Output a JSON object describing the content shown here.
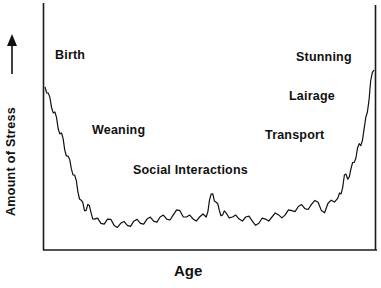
{
  "chart_data": {
    "type": "line",
    "title": "",
    "xlabel": "Age",
    "ylabel": "Amount of Stress",
    "ylabel_arrow": "up",
    "grid": false,
    "legend": null,
    "axis_ranges": {
      "x": [
        0,
        100
      ],
      "y": [
        0,
        100
      ]
    },
    "ticks": {
      "x": [],
      "y": []
    },
    "annotations": [
      {
        "text": "Birth",
        "x": 4,
        "y": 78
      },
      {
        "text": "Weaning",
        "x": 15,
        "y": 48
      },
      {
        "text": "Social Interactions",
        "x": 27,
        "y": 32
      },
      {
        "text": "Stunning",
        "x": 76,
        "y": 77
      },
      {
        "text": "Lairage",
        "x": 74,
        "y": 61
      },
      {
        "text": "Transport",
        "x": 67,
        "y": 46
      }
    ],
    "series": [
      {
        "name": "Stress",
        "description": "U-shaped noisy curve: high at birth, drops through weaning to a low plateau, small peak at social interactions, rises through transport and lairage to maximum at stunning",
        "x": [
          0,
          1,
          2,
          3,
          4,
          5,
          6,
          7,
          8,
          9,
          10,
          11,
          12,
          13,
          14,
          15,
          17,
          19,
          21,
          23,
          25,
          27,
          29,
          31,
          33,
          35,
          37,
          39,
          41,
          43,
          45,
          47,
          49,
          50,
          51,
          52,
          53,
          54,
          55,
          57,
          59,
          61,
          63,
          65,
          67,
          69,
          71,
          73,
          75,
          77,
          79,
          81,
          83,
          85,
          87,
          89,
          90,
          91,
          92,
          93,
          94,
          95,
          96,
          97,
          98,
          99,
          100
        ],
        "y": [
          72,
          69,
          62,
          60,
          52,
          50,
          42,
          39,
          33,
          30,
          22,
          18,
          13,
          16,
          12,
          9,
          7,
          9,
          6,
          7,
          6,
          8,
          7,
          9,
          8,
          10,
          9,
          11,
          13,
          10,
          9,
          10,
          10,
          18,
          21,
          17,
          13,
          11,
          12,
          10,
          9,
          10,
          8,
          7,
          9,
          10,
          11,
          11,
          13,
          15,
          14,
          16,
          17,
          12,
          18,
          19,
          21,
          30,
          28,
          33,
          36,
          43,
          44,
          52,
          60,
          75,
          80
        ]
      }
    ]
  },
  "axes": {
    "x_label": "Age",
    "y_label": "Amount of Stress"
  },
  "annotations": {
    "birth": "Birth",
    "weaning": "Weaning",
    "social": "Social Interactions",
    "stunning": "Stunning",
    "lairage": "Lairage",
    "transport": "Transport"
  }
}
